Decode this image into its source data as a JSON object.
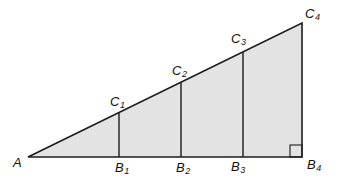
{
  "diagram": {
    "type": "geometry-figure",
    "figure_summary": "Right triangle A B4 C4 with interior verticals B1C1, B2C2, B3C3 from the base to the hypotenuse and a right-angle marker at B4",
    "labels": {
      "A": {
        "base": "A",
        "sub": ""
      },
      "B1": {
        "base": "B",
        "sub": "1"
      },
      "B2": {
        "base": "B",
        "sub": "2"
      },
      "B3": {
        "base": "B",
        "sub": "3"
      },
      "B4": {
        "base": "B",
        "sub": "4"
      },
      "C1": {
        "base": "C",
        "sub": "1"
      },
      "C2": {
        "base": "C",
        "sub": "2"
      },
      "C3": {
        "base": "C",
        "sub": "3"
      },
      "C4": {
        "base": "C",
        "sub": "4"
      }
    },
    "colors": {
      "triangle_fill": "#e3e3e3",
      "line": "#1c1c1c",
      "background": "#ffffff"
    }
  }
}
